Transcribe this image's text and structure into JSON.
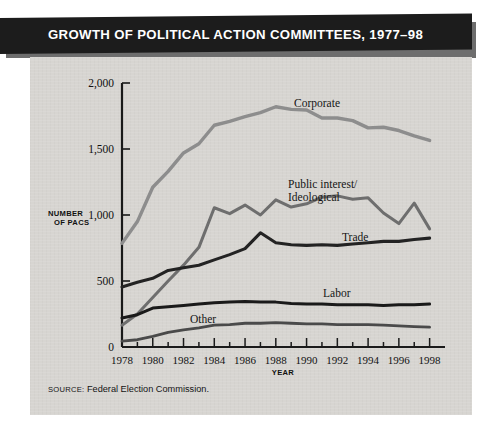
{
  "banner": {
    "title": "GROWTH OF POLITICAL ACTION COMMITTEES, 1977–98"
  },
  "source": {
    "keyword": "SOURCE:",
    "text": " Federal Election Commission."
  },
  "axes": {
    "y_title_line1": "NUMBER",
    "y_title_line2": "OF PACS",
    "x_title": "YEAR",
    "y_ticks": [
      "0",
      "500",
      "1,000",
      "1,500",
      "2,000"
    ],
    "x_ticks": [
      "1978",
      "1980",
      "1982",
      "1984",
      "1986",
      "1988",
      "1990",
      "1992",
      "1994",
      "1996",
      "1998"
    ]
  },
  "labels": {
    "corporate": "Corporate",
    "public_interest_l1": "Public interest/",
    "public_interest_l2": "Ideological",
    "trade": "Trade",
    "labor": "Labor",
    "other": "Other"
  },
  "colors": {
    "panel": "#d7d5d1",
    "banner": "#1c1c1c",
    "corporate_line": "#8d8d8d",
    "public_interest_line": "#6e6e6e",
    "trade_line": "#232323",
    "labor_line": "#1a1a1a",
    "other_line": "#4a4a4a"
  },
  "chart_data": {
    "type": "line",
    "title": "GROWTH OF POLITICAL ACTION COMMITTEES, 1977–98",
    "xlabel": "YEAR",
    "ylabel": "NUMBER OF PACS",
    "xlim": [
      1978,
      1999
    ],
    "ylim": [
      0,
      2000
    ],
    "yticks": [
      0,
      500,
      1000,
      1500,
      2000
    ],
    "xticks": [
      1978,
      1980,
      1982,
      1984,
      1986,
      1988,
      1990,
      1992,
      1994,
      1996,
      1998
    ],
    "grid": false,
    "legend": "inline-series-labels",
    "x": [
      1978,
      1979,
      1980,
      1981,
      1982,
      1983,
      1984,
      1985,
      1986,
      1987,
      1988,
      1989,
      1990,
      1991,
      1992,
      1993,
      1994,
      1995,
      1996,
      1997,
      1998
    ],
    "series": [
      {
        "name": "Corporate",
        "color": "#8d8d8d",
        "values": [
          785,
          950,
          1210,
          1330,
          1470,
          1540,
          1680,
          1710,
          1745,
          1775,
          1820,
          1800,
          1795,
          1735,
          1735,
          1715,
          1660,
          1665,
          1640,
          1600,
          1565
        ]
      },
      {
        "name": "Public interest/Ideological",
        "color": "#6e6e6e",
        "values": [
          165,
          250,
          375,
          500,
          620,
          755,
          1055,
          1010,
          1075,
          1000,
          1115,
          1060,
          1085,
          1135,
          1145,
          1120,
          1130,
          1015,
          935,
          1090,
          895
        ]
      },
      {
        "name": "Trade",
        "color": "#232323",
        "values": [
          455,
          490,
          520,
          580,
          600,
          620,
          660,
          700,
          745,
          865,
          790,
          775,
          770,
          775,
          770,
          780,
          790,
          800,
          800,
          815,
          825
        ]
      },
      {
        "name": "Labor",
        "color": "#1a1a1a",
        "values": [
          220,
          245,
          295,
          305,
          315,
          325,
          335,
          340,
          345,
          340,
          340,
          330,
          325,
          325,
          320,
          320,
          320,
          315,
          320,
          320,
          325
        ]
      },
      {
        "name": "Other",
        "color": "#4a4a4a",
        "values": [
          45,
          55,
          80,
          110,
          130,
          145,
          165,
          170,
          180,
          180,
          185,
          180,
          175,
          175,
          170,
          170,
          170,
          165,
          160,
          155,
          150
        ]
      }
    ]
  }
}
